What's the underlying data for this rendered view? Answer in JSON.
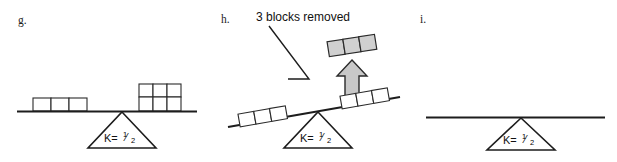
{
  "figure": {
    "width": 617,
    "height": 162,
    "background": "#ffffff",
    "ink_color": "#1d1d1d",
    "block_fill": "#ffffff",
    "highlight_fill": "#d0d0d0",
    "arrow_fill": "#c8c8c8"
  },
  "panels": [
    {
      "id": "g",
      "label": "g.",
      "fulcrum_label": "K=",
      "fulcrum_numerator": "1",
      "fulcrum_denominator": "2",
      "fulcrum_fraction_slash": "⁄",
      "beam_state": "level",
      "left_blocks": 3,
      "right_blocks": 6,
      "right_block_rows": 2,
      "right_block_cols": 3
    },
    {
      "id": "h",
      "label": "h.",
      "fulcrum_label": "K=",
      "fulcrum_numerator": "1",
      "fulcrum_denominator": "2",
      "fulcrum_fraction_slash": "⁄",
      "beam_state": "tilted-left-down",
      "left_blocks": 3,
      "right_blocks": 3,
      "removed_blocks": 3,
      "callout": "3 blocks removed",
      "arrow_direction": "up"
    },
    {
      "id": "i",
      "label": "i.",
      "fulcrum_label": "K=",
      "fulcrum_numerator": "1",
      "fulcrum_denominator": "2",
      "fulcrum_fraction_slash": "⁄",
      "beam_state": "level",
      "left_blocks": 0,
      "right_blocks": 0
    }
  ]
}
